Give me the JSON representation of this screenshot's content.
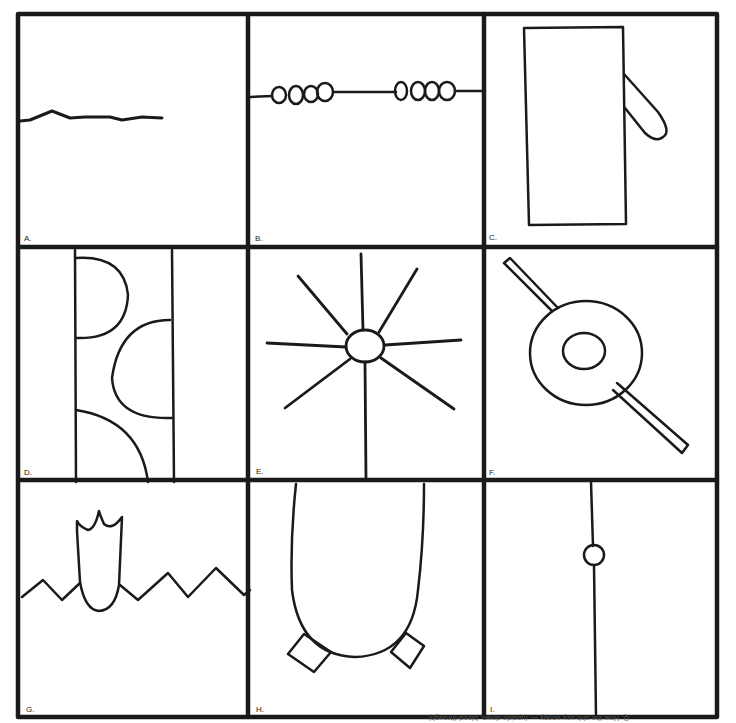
{
  "figure": {
    "panels": [
      {
        "id": "A",
        "label": "A.",
        "content": "wavy horizontal line from left edge"
      },
      {
        "id": "B",
        "label": "B.",
        "content": "horizontal line with two groups of four beads"
      },
      {
        "id": "C",
        "label": "C.",
        "content": "tall rectangle with finger-like projection on right"
      },
      {
        "id": "D",
        "label": "D.",
        "content": "vertical strip with three semicircular lobes"
      },
      {
        "id": "E",
        "label": "E.",
        "content": "small oval with eight radiating lines"
      },
      {
        "id": "F",
        "label": "F.",
        "content": "ring with inner oval pierced by diagonal rod"
      },
      {
        "id": "G",
        "label": "G.",
        "content": "crowned bulb rising from zigzag line"
      },
      {
        "id": "H",
        "label": "H.",
        "content": "large U-shaped body with two square feet"
      },
      {
        "id": "I",
        "label": "I.",
        "content": "vertical line with small circle"
      }
    ],
    "footer_text": "Q. How the shh uey uoopy — (upside-down, bleed-through)"
  },
  "colors": {
    "ink": "#1a1a1a",
    "paper": "#ffffff"
  }
}
